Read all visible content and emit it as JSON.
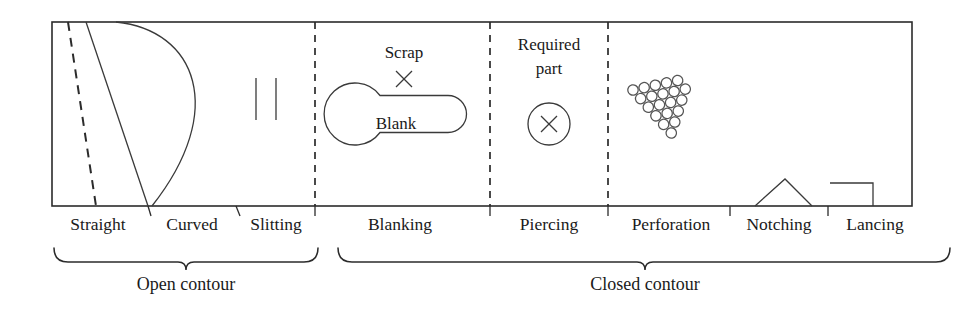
{
  "figure": {
    "title": "Sheet metal cutting operations: open and closed contour",
    "frame": {
      "x": 52,
      "y": 22,
      "width": 860,
      "height": 184
    }
  },
  "operations": [
    {
      "id": "straight",
      "label": "Straight",
      "label_x": 98,
      "label_y": 230
    },
    {
      "id": "curved",
      "label": "Curved",
      "label_x": 192,
      "label_y": 230
    },
    {
      "id": "slitting",
      "label": "Slitting",
      "label_x": 276,
      "label_y": 230
    },
    {
      "id": "blanking",
      "label": "Blanking",
      "label_x": 400,
      "label_y": 230
    },
    {
      "id": "piercing",
      "label": "Piercing",
      "label_x": 549,
      "label_y": 230
    },
    {
      "id": "perforation",
      "label": "Perforation",
      "label_x": 671,
      "label_y": 230
    },
    {
      "id": "notching",
      "label": "Notching",
      "label_x": 779,
      "label_y": 230
    },
    {
      "id": "lancing",
      "label": "Lancing",
      "label_x": 875,
      "label_y": 230
    }
  ],
  "inner_labels": {
    "scrap": {
      "text": "Scrap",
      "x": 404,
      "y": 58
    },
    "blank": {
      "text": "Blank",
      "x": 396,
      "y": 129
    },
    "required_part_line1": {
      "text": "Required",
      "x": 549,
      "y": 50
    },
    "required_part_line2": {
      "text": "part",
      "x": 549,
      "y": 74
    }
  },
  "groups": [
    {
      "id": "open-contour",
      "label": "Open contour",
      "label_x": 186,
      "label_y": 290,
      "brace_x1": 54,
      "brace_x2": 318
    },
    {
      "id": "closed-contour",
      "label": "Closed contour",
      "label_x": 645,
      "label_y": 290,
      "brace_x1": 338,
      "brace_x2": 950
    }
  ],
  "dividers": [
    {
      "id": "divider-1",
      "x": 315
    },
    {
      "id": "divider-2",
      "x": 490
    },
    {
      "id": "divider-3",
      "x": 608
    }
  ],
  "label_ticks": [
    148,
    236,
    315,
    490,
    608,
    730,
    828,
    912
  ],
  "colors": {
    "line": "#2b2b2b",
    "perforation_outline": "#555555",
    "background": "#ffffff",
    "text": "#1a1a1a"
  },
  "shapes": {
    "straight_dashed_line": {
      "x1": 68,
      "y1": 22,
      "x2": 96,
      "y2": 206
    },
    "straight_solid_line": {
      "x1": 86,
      "y1": 22,
      "x2": 148,
      "y2": 206
    },
    "curved_arc": {
      "start_x": 116,
      "start_y": 22,
      "end_x": 152,
      "end_y": 206,
      "bulge_x": 218
    },
    "slitting_lines": [
      {
        "x": 256,
        "y1": 78,
        "y2": 120
      },
      {
        "x": 276,
        "y1": 78,
        "y2": 120
      }
    ],
    "scrap_marker": {
      "cx": 404,
      "cy": 79,
      "size": 9
    },
    "blank_keyhole": {
      "circle_cx": 369,
      "circle_cy": 122,
      "circle_r": 31,
      "bar_x": 369,
      "bar_y": 104,
      "bar_w": 98,
      "bar_h": 37
    },
    "piercing_circle": {
      "cx": 549,
      "cy": 124,
      "r": 21,
      "cross_size": 9
    },
    "perforation_cluster": {
      "origin_x": 629,
      "origin_y": 92,
      "spacing": 11.4,
      "radius": 5.2,
      "rows": 6,
      "rotation_deg": -12
    },
    "notching_peak": {
      "left_x": 755,
      "apex_x": 785,
      "right_x": 812,
      "base_y": 206,
      "apex_y": 179
    },
    "lancing_flap": {
      "left_x": 830,
      "right_x": 873,
      "top_y": 183,
      "base_y": 206
    }
  }
}
